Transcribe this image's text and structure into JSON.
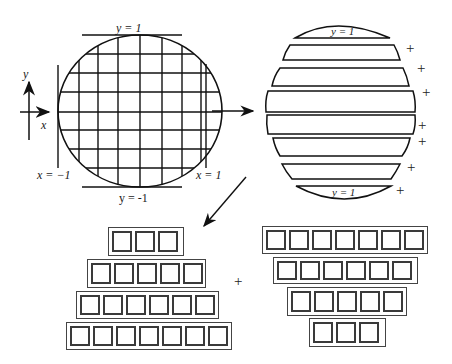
{
  "figure": {
    "circle_panel": {
      "axis_labels": {
        "x": "x",
        "y": "y"
      },
      "boundary_labels": {
        "top": "y = 1",
        "bottom": "y = -1",
        "left": "x = −1",
        "right": "x = 1"
      },
      "grid": {
        "cells_across": 8,
        "cells_down": 8
      }
    },
    "strip_panel": {
      "strip_count": 8,
      "top_cap_label": "y = 1",
      "bottom_cap_label": "y = 1",
      "plus_sign": "+",
      "plus_count": 7
    },
    "block_panel": {
      "plus_sign": "+",
      "left_stack_rows": [
        3,
        5,
        6,
        7
      ],
      "right_stack_rows": [
        7,
        6,
        5,
        3
      ]
    },
    "arrows": [
      "circle-to-strips",
      "strips-to-blocks"
    ],
    "colors": {
      "ink": "#1a1a1a",
      "block_border": "#3a3a3a",
      "background": "#ffffff"
    }
  }
}
